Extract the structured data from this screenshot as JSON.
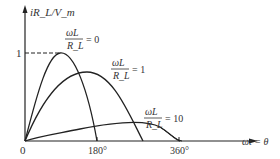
{
  "diagram": {
    "y_axis_label": "iR_L/V_m",
    "x_axis_label": "ωt = θ",
    "origin_label": "0",
    "y_tick": "1",
    "x_ticks": [
      "180°",
      "360°"
    ],
    "curves": [
      {
        "num": "ωL",
        "den": "R_L",
        "value": "= 0"
      },
      {
        "num": "ωL",
        "den": "R_L",
        "value": "= 1"
      },
      {
        "num": "ωL",
        "den": "R_L",
        "value": "= 10"
      }
    ]
  }
}
